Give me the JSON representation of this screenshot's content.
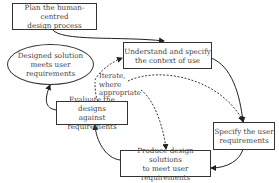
{
  "diagram": {
    "type": "process-cycle",
    "nodes": {
      "plan": {
        "line1": "Plan the human-centred",
        "line2": "design process"
      },
      "understand": {
        "line1": "Understand and specify",
        "line2": "the context of use"
      },
      "specify": {
        "line1": "Specify the user",
        "line2": "requirements"
      },
      "produce": {
        "line1": "Produce design solutions",
        "line2": "to meet user requirements"
      },
      "evaluate": {
        "line1": "Evaluate the designs",
        "line2": "against requirements"
      },
      "solution": {
        "line1": "Designed solution",
        "line2": "meets user requirements"
      }
    },
    "iterate_note": {
      "line1": "Iterate,",
      "line2": "where",
      "line3": "appropriate"
    },
    "edges": [
      {
        "from": "plan",
        "to": "understand",
        "style": "solid"
      },
      {
        "from": "understand",
        "to": "specify",
        "style": "solid"
      },
      {
        "from": "specify",
        "to": "produce",
        "style": "solid"
      },
      {
        "from": "produce",
        "to": "evaluate",
        "style": "solid"
      },
      {
        "from": "evaluate",
        "to": "solution",
        "style": "solid"
      },
      {
        "from": "evaluate",
        "to": "understand",
        "style": "dashed"
      },
      {
        "from": "evaluate",
        "to": "specify",
        "style": "dashed"
      },
      {
        "from": "evaluate",
        "to": "produce",
        "style": "dashed"
      }
    ]
  }
}
